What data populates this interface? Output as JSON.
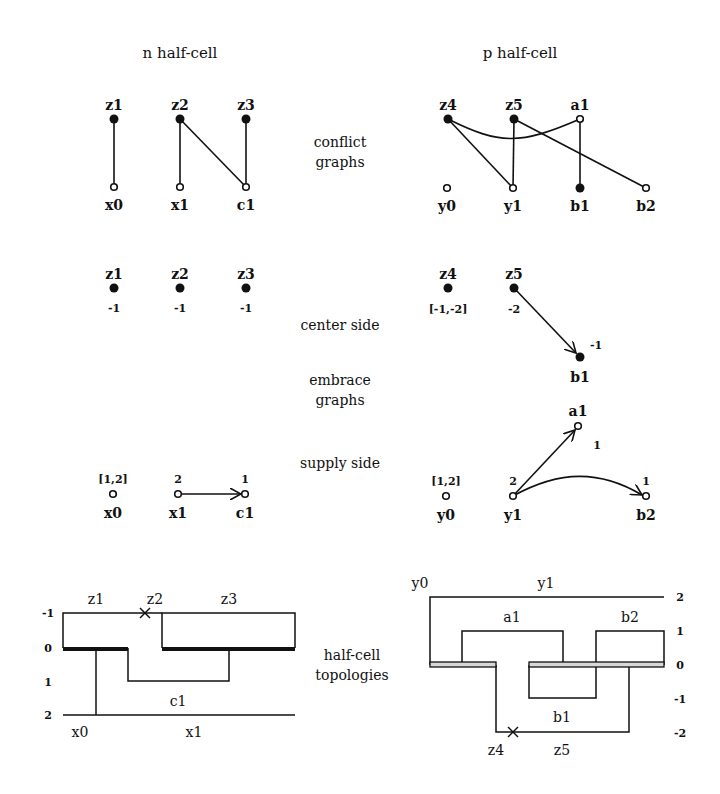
{
  "headers": {
    "n": "n half-cell",
    "p": "p half-cell"
  },
  "row_labels": {
    "conflict": [
      "conflict",
      "graphs"
    ],
    "center": "center side",
    "embrace": [
      "embrace",
      "graphs"
    ],
    "supply": "supply side",
    "topologies": [
      "half-cell",
      "topologies"
    ]
  },
  "conflict_graphs": {
    "n": {
      "top": [
        {
          "id": "z1",
          "filled": true
        },
        {
          "id": "z2",
          "filled": true
        },
        {
          "id": "z3",
          "filled": true
        }
      ],
      "bottom": [
        {
          "id": "x0",
          "filled": false
        },
        {
          "id": "x1",
          "filled": false
        },
        {
          "id": "c1",
          "filled": false
        }
      ],
      "edges": [
        [
          "z1",
          "x0"
        ],
        [
          "z2",
          "x1"
        ],
        [
          "z2",
          "c1"
        ],
        [
          "z3",
          "c1"
        ]
      ]
    },
    "p": {
      "top": [
        {
          "id": "z4",
          "filled": true
        },
        {
          "id": "z5",
          "filled": true
        },
        {
          "id": "a1",
          "filled": false
        }
      ],
      "bottom": [
        {
          "id": "y0",
          "filled": false
        },
        {
          "id": "y1",
          "filled": false
        },
        {
          "id": "b1",
          "filled": true
        },
        {
          "id": "b2",
          "filled": false
        }
      ],
      "edges": [
        [
          "z4",
          "y1"
        ],
        [
          "z4",
          "a1"
        ],
        [
          "z5",
          "y1"
        ],
        [
          "z5",
          "b2"
        ],
        [
          "a1",
          "b1"
        ]
      ]
    }
  },
  "center_side": {
    "n": [
      {
        "id": "z1",
        "value": "-1"
      },
      {
        "id": "z2",
        "value": "-1"
      },
      {
        "id": "z3",
        "value": "-1"
      }
    ],
    "p": [
      {
        "id": "z4",
        "value": "[-1,-2]"
      },
      {
        "id": "z5",
        "value": "-2"
      },
      {
        "id": "b1",
        "value": "-1"
      }
    ],
    "p_edges": [
      [
        "z5",
        "b1"
      ]
    ]
  },
  "supply_side": {
    "n": [
      {
        "id": "x0",
        "value": "[1,2]"
      },
      {
        "id": "x1",
        "value": "2"
      },
      {
        "id": "c1",
        "value": "1"
      }
    ],
    "n_edges": [
      [
        "x1",
        "c1"
      ]
    ],
    "p": [
      {
        "id": "y0",
        "value": "[1,2]"
      },
      {
        "id": "y1",
        "value": "2"
      },
      {
        "id": "a1",
        "value": "1"
      },
      {
        "id": "b2",
        "value": "1"
      }
    ],
    "p_edges": [
      [
        "y1",
        "a1"
      ],
      [
        "y1",
        "b2"
      ]
    ]
  },
  "topologies": {
    "n": {
      "levels": [
        "-1",
        "0",
        "1",
        "2"
      ],
      "labels_top": [
        "z1",
        "z2",
        "z3"
      ],
      "label_mid": "c1",
      "labels_bottom": [
        "x0",
        "x1"
      ]
    },
    "p": {
      "levels": [
        "2",
        "1",
        "0",
        "-1",
        "-2"
      ],
      "labels_top": [
        "y0",
        "y1"
      ],
      "labels_row1": [
        "a1",
        "b2"
      ],
      "label_mid": "b1",
      "labels_bottom": [
        "z4",
        "z5"
      ]
    }
  }
}
